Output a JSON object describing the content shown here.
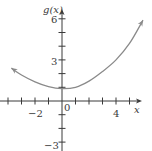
{
  "chart_data": {
    "type": "line",
    "title": "",
    "xlabel": "x",
    "ylabel": "g(x)",
    "x_tick_labels": [
      "-2",
      "0",
      "4"
    ],
    "y_tick_labels": [
      "6",
      "3",
      "-3"
    ],
    "x_ticks": [
      -4,
      -3,
      -2,
      -1,
      1,
      2,
      3,
      4,
      5
    ],
    "y_ticks": [
      6,
      5,
      4,
      3,
      2,
      1,
      -1,
      -2,
      -3
    ],
    "xlim": [
      -4.6,
      5.9
    ],
    "ylim": [
      -3.6,
      6.6
    ],
    "grid": false,
    "legend": null,
    "series": [
      {
        "name": "g(x)",
        "color": "#8a8a8a",
        "arrows_both_ends": true,
        "x": [
          -3.75,
          -3,
          -2,
          -1,
          0,
          1,
          2,
          3,
          4,
          5,
          6
        ],
        "y": [
          2.4,
          1.9,
          1.4,
          1.05,
          0.9,
          1.0,
          1.45,
          2.15,
          3.0,
          4.2,
          5.9
        ]
      }
    ]
  },
  "labels": {
    "y_axis": "g(x)",
    "x_axis": "x",
    "y6": "6",
    "y3": "3",
    "yneg3": "−3",
    "xneg2": "−2",
    "x0": "0",
    "x4": "4"
  },
  "colors": {
    "axis": "#3a3a3a",
    "curve": "#8a8a8a",
    "background": "#ffffff"
  }
}
